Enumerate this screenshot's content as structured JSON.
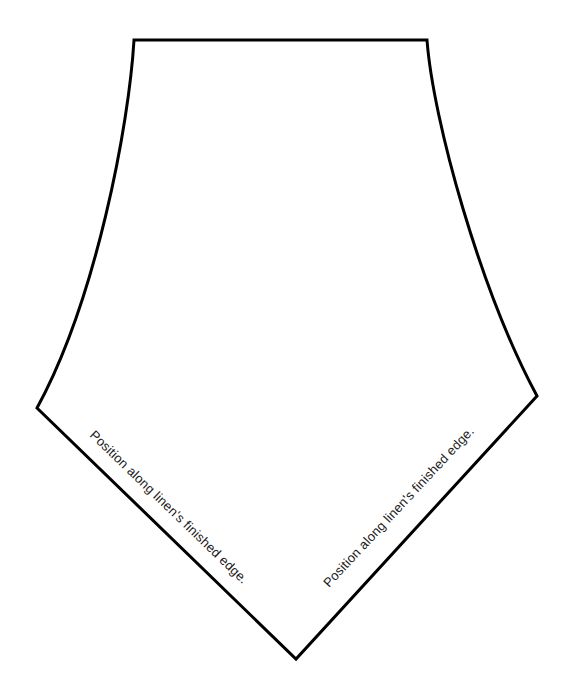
{
  "document": {
    "type": "sewing-pattern-template",
    "title": "Pentagon linen pattern piece",
    "background_color": "#ffffff",
    "outline_color": "#000000",
    "outline_width_px": 3
  },
  "shape": {
    "name": "pentagon-pattern-piece",
    "vertices": [
      {
        "name": "top-left-corner",
        "x": 134,
        "y": 40
      },
      {
        "name": "top-right-corner",
        "x": 427,
        "y": 40
      },
      {
        "name": "right-side-vertex",
        "x": 537,
        "y": 396
      },
      {
        "name": "bottom-apex",
        "x": 296,
        "y": 659
      },
      {
        "name": "left-side-vertex",
        "x": 37,
        "y": 408
      }
    ],
    "edges": [
      {
        "name": "top-edge",
        "style": "straight"
      },
      {
        "name": "right-upper-edge",
        "style": "curved"
      },
      {
        "name": "bottom-right-edge",
        "style": "straight"
      },
      {
        "name": "bottom-left-edge",
        "style": "straight"
      },
      {
        "name": "left-upper-edge",
        "style": "curved"
      }
    ]
  },
  "labels": {
    "left_edge": {
      "text": "Position along linen's finished edge.",
      "rotation_deg": 44,
      "x": 89,
      "y": 436
    },
    "right_edge": {
      "text": "Position along linen's finished edge.",
      "rotation_deg": -47,
      "x": 329,
      "y": 588
    }
  }
}
